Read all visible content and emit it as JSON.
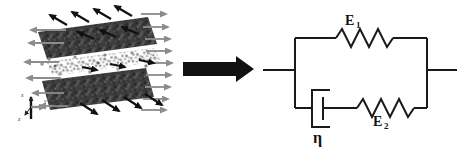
{
  "figure_colors": {
    "ink": "#1a1a1a",
    "black_arrow": "#111111",
    "gray_arrow": "#8c8c8c"
  },
  "molecular_panel": {
    "axis_labels": {
      "x": "x",
      "y": "y",
      "z": "z"
    }
  },
  "model_panel": {
    "spring_top_label": {
      "symbol": "E",
      "subscript": "1"
    },
    "spring_bottom_label": {
      "symbol": "E",
      "subscript": "2"
    },
    "dashpot_label": "η"
  }
}
